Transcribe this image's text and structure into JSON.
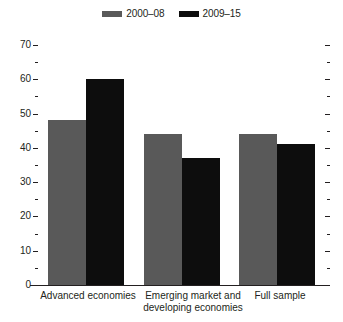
{
  "chart_data": {
    "type": "bar",
    "title": "",
    "xlabel": "",
    "ylabel": "",
    "ylim": [
      0,
      70
    ],
    "ytick_step": 10,
    "yminor_step": 5,
    "grid": false,
    "legend_position": "top-center",
    "categories": [
      "Advanced economies",
      "Emerging market and\ndeveloping economies",
      "Full sample"
    ],
    "series": [
      {
        "name": "2000–08",
        "color": "#595959",
        "values": [
          48,
          44,
          44
        ]
      },
      {
        "name": "2009–15",
        "color": "#0d0d0d",
        "values": [
          60,
          37,
          41
        ]
      }
    ],
    "ytick_labels": [
      "0",
      "10",
      "20",
      "30",
      "40",
      "50",
      "60",
      "70"
    ],
    "ytick_values": [
      0,
      10,
      20,
      30,
      40,
      50,
      60,
      70
    ],
    "yminor_values": [
      5,
      15,
      25,
      35,
      45,
      55,
      65
    ]
  },
  "legend": {
    "entries": [
      {
        "label": "2000–08",
        "color": "#595959",
        "swatch": "legend-swatch-gray"
      },
      {
        "label": "2009–15",
        "color": "#0d0d0d",
        "swatch": "legend-swatch-black"
      }
    ]
  },
  "axis": {
    "y_labels": [
      "70",
      "60",
      "50",
      "40",
      "30",
      "20",
      "10",
      "0"
    ]
  },
  "categories": [
    {
      "label": "Advanced economies"
    },
    {
      "label": "Emerging market and\ndeveloping economies"
    },
    {
      "label": "Full sample"
    }
  ]
}
